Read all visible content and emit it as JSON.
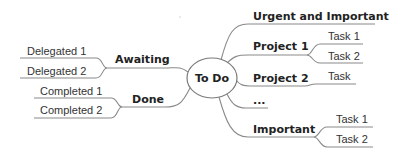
{
  "center": {
    "label": "To Do"
  },
  "left": [
    {
      "label": "Awaiting",
      "children": [
        "Delegated 1",
        "Delegated 2"
      ]
    },
    {
      "label": "Done",
      "children": [
        "Completed 1",
        "Completed 2"
      ]
    }
  ],
  "right": [
    {
      "label": "Urgent and Important",
      "children": []
    },
    {
      "label": "Project 1",
      "children": [
        "Task 1",
        "Task 2"
      ]
    },
    {
      "label": "Project 2",
      "children": [
        "Task"
      ]
    },
    {
      "label": "...",
      "children": []
    },
    {
      "label": "Important",
      "children": [
        "Task 1",
        "Task 2"
      ]
    }
  ],
  "colors": {
    "line": "#8a8a8a",
    "text": "#222222",
    "background": "#ffffff"
  }
}
